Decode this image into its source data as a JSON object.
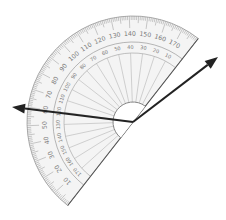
{
  "diagram": {
    "type": "protractor-angle-measurement",
    "protractor": {
      "center": [
        133,
        122
      ],
      "outer_radius": 106,
      "inner_scale_radius": 80,
      "center_arc_radius": 20,
      "baseline_angle_deg": 128,
      "outer_labels": [
        "0",
        "10",
        "20",
        "30",
        "40",
        "50",
        "60",
        "70",
        "80",
        "90",
        "100",
        "110",
        "120",
        "130",
        "140",
        "150",
        "160",
        "170",
        "180"
      ],
      "inner_labels": [
        "180",
        "170",
        "160",
        "150",
        "140",
        "130",
        "120",
        "110",
        "100",
        "90",
        "80",
        "70",
        "60",
        "50",
        "40",
        "30",
        "20",
        "10",
        "0"
      ],
      "colors": {
        "body_fill": "#f4f4f4",
        "outline": "#9a9a9a",
        "ticks": "#8a8a8a",
        "labels": "#7a7a7a",
        "rays": "#b5b5b5"
      }
    },
    "arrows": [
      {
        "name": "arrow-upper-right",
        "from": [
          133,
          122
        ],
        "to": [
          218,
          57
        ],
        "color": "#222222"
      },
      {
        "name": "arrow-left",
        "from": [
          133,
          122
        ],
        "to": [
          12,
          107
        ],
        "color": "#222222"
      }
    ]
  }
}
